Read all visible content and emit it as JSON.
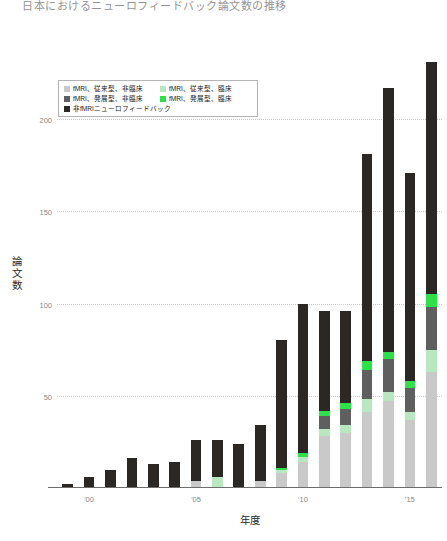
{
  "chart_data": {
    "type": "bar",
    "stacked": true,
    "title": "日本におけるニューロフィードバック論文数の推移",
    "xlabel": "年度",
    "ylabel": "論文数",
    "ylim": [
      0,
      232
    ],
    "grid": true,
    "legend_position": "upper-left-inside",
    "y_ticks": [
      50,
      100,
      150,
      200
    ],
    "y_tick_labels": [
      "50",
      "100",
      "150",
      "200"
    ],
    "x": [
      1999,
      2000,
      2001,
      2002,
      2003,
      2004,
      2005,
      2006,
      2007,
      2008,
      2009,
      2010,
      2011,
      2012,
      2013,
      2014,
      2015,
      2016
    ],
    "x_ticks": [
      2000,
      2005,
      2010,
      2015
    ],
    "x_tick_labels": [
      "'00",
      "'05",
      "'10",
      "'15"
    ],
    "colors": {
      "fmri_conventional_nonclinical": "#c9c9c9",
      "fmri_conventional_clinical": "#b9e8c0",
      "fmri_advanced_nonclinical": "#5f5f5f",
      "fmri_advanced_clinical": "#2fe04a",
      "non_fmri_neurofeedback": "#2b2724"
    },
    "series": [
      {
        "name": "fMRI、従来型、非臨床",
        "color": "#c9c9c9",
        "values": [
          0,
          0,
          0,
          0,
          0,
          0,
          4,
          0,
          0,
          4,
          8,
          14,
          28,
          30,
          41,
          47,
          37,
          63
        ]
      },
      {
        "name": "fMRI、従来型、臨床",
        "color": "#b9e8c0",
        "values": [
          0,
          0,
          0,
          0,
          0,
          0,
          0,
          6,
          0,
          0,
          2,
          3,
          4,
          4,
          7,
          5,
          4,
          12
        ]
      },
      {
        "name": "fMRI、発展型、非臨床",
        "color": "#5f5f5f",
        "values": [
          0,
          0,
          0,
          0,
          0,
          0,
          0,
          0,
          0,
          0,
          0,
          0,
          7,
          9,
          16,
          18,
          13,
          23
        ]
      },
      {
        "name": "fMRI、発展型、臨床",
        "color": "#2fe04a",
        "values": [
          0,
          0,
          0,
          0,
          0,
          0,
          0,
          0,
          0,
          0,
          1,
          2,
          3,
          3,
          5,
          4,
          4,
          7
        ]
      },
      {
        "name": "非fMRIニューロフィードバック",
        "color": "#2b2724",
        "values": [
          2,
          6,
          10,
          16,
          13,
          14,
          22,
          20,
          24,
          30,
          69,
          81,
          54,
          50,
          112,
          143,
          113,
          126
        ]
      }
    ],
    "totals": [
      2,
      6,
      10,
      16,
      13,
      14,
      26,
      26,
      24,
      34,
      80,
      100,
      96,
      96,
      181,
      217,
      171,
      231
    ]
  },
  "legend": {
    "items": [
      {
        "label": "fMRI、従来型、非臨床",
        "color": "#c9c9c9"
      },
      {
        "label": "fMRI、従来型、臨床",
        "color": "#b9e8c0"
      },
      {
        "label": "fMRI、発展型、非臨床",
        "color": "#5f5f5f"
      },
      {
        "label": "fMRI、発展型、臨床",
        "color": "#2fe04a"
      },
      {
        "label": "非fMRIニューロフィードバック",
        "color": "#2b2724"
      }
    ]
  }
}
